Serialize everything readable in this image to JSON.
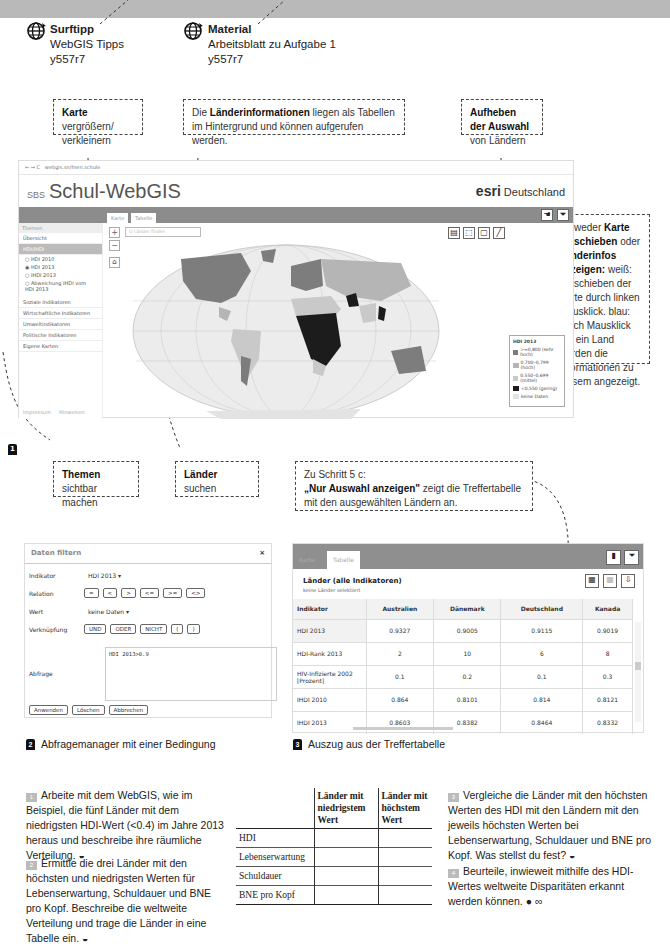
{
  "surftipp": {
    "title": "Surftipp",
    "line1": "WebGIS Tipps",
    "code": "y557r7"
  },
  "material": {
    "title": "Material",
    "line1": "Arbeitsblatt zu Aufgabe 1",
    "code": "y557r7"
  },
  "callouts": {
    "zoom": {
      "bold": "Karte",
      "rest": " vergrößern/ verkleinern"
    },
    "tables": {
      "pre": "Die ",
      "bold": "Länderinformationen",
      "rest": " liegen als Tabellen im Hintergrund und können aufgerufen werden."
    },
    "deselect": {
      "bold": "Aufheben der Auswahl",
      "rest": " von Ländern"
    },
    "pan": {
      "pre": "Entweder ",
      "bold1": "Karte verschieben",
      "mid": " oder ",
      "bold2": "Länderinfos anzeigen:",
      "rest": " weiß: Verschieben der Karte durch linken Mausklick. blau: durch Mausklick auf ein Land werden die Informationen zu diesem angezeigt."
    },
    "themes": {
      "bold": "Themen",
      "rest": " sichtbar machen"
    },
    "search": {
      "bold": "Länder",
      "rest": " suchen"
    },
    "step5c": {
      "line1": "Zu Schritt 5 c:",
      "bold": "„Nur Auswahl anzeigen\"",
      "rest": " zeigt die Treffertabelle mit den ausgewählten Ländern an."
    }
  },
  "webgis": {
    "address": "webgis.sn/fnen.schule",
    "brand_small": "SBS",
    "brand_title": "Schul-WebGIS",
    "esri_logo": "esri",
    "esri_text": "Deutschland",
    "tabs": [
      "Karte",
      "Tabelle"
    ],
    "search_placeholder": "Q Länder finden",
    "sidebar": {
      "header": "Themen",
      "items_top": [
        "Übersicht",
        "HDI/IHDI"
      ],
      "radios": [
        "HDI 2010",
        "HDI 2013",
        "IHDI 2013",
        "Abweichung IHDI vom HDI 2013"
      ],
      "selected_radio": 1,
      "items_bottom": [
        "Soziale Indikatoren",
        "Wirtschaftliche Indikatoren",
        "Umweltindikatoren",
        "Politische Indikatoren",
        "Eigene Karten"
      ],
      "footer": [
        "Impressum",
        "Hinweisen"
      ]
    },
    "legend": {
      "title": "HDI 2013",
      "items": [
        {
          "label": ">=0,800 (sehr hoch)",
          "color": "#7d7d7d"
        },
        {
          "label": "0,700–0,799 (hoch)",
          "color": "#b5b5b5"
        },
        {
          "label": "0,550–0,699 (mittel)",
          "color": "#c9c9c9"
        },
        {
          "label": "<0,550 (gering)",
          "color": "#1c1c1c"
        },
        {
          "label": "keine Daten",
          "color": "#e3e3e3"
        }
      ]
    }
  },
  "figures": {
    "fig1": "1",
    "fig2": {
      "num": "2",
      "label": "Abfragemanager mit einer Bedingung"
    },
    "fig3": {
      "num": "3",
      "label": "Auszug aus der Treffertabelle"
    }
  },
  "filter_dialog": {
    "title": "Daten filtern",
    "close": "×",
    "indikator_label": "Indikator",
    "indikator_value": "HDI 2013 ▾",
    "relation_label": "Relation",
    "relations": [
      "=",
      "<",
      ">",
      "<=",
      ">=",
      "<>"
    ],
    "wert_label": "Wert",
    "wert_value": "keine Daten ▾",
    "verknuepfung_label": "Verknüpfung",
    "logic": [
      "UND",
      "ODER",
      "NICHT",
      "(",
      ")"
    ],
    "abfrage_label": "Abfrage",
    "query": "HDI 2013>0.9",
    "buttons": [
      "Anwenden",
      "Löschen",
      "Abbrechen"
    ]
  },
  "result_table": {
    "tabs": [
      "Karte",
      "Tabelle"
    ],
    "title": "Länder (alle Indikatoren)",
    "subtitle": "keine Länder selektiert",
    "columns": [
      "Indikator",
      "Australien",
      "Dänemark",
      "Deutschland",
      "Kanada"
    ],
    "rows": [
      [
        "HDI 2013",
        "0.9327",
        "0.9005",
        "0.9115",
        "0.9019"
      ],
      [
        "HDI-Rank 2013",
        "2",
        "10",
        "6",
        "8"
      ],
      [
        "HIV-Infizierte 2002 [Prozent]",
        "0.1",
        "0.2",
        "0.1",
        "0.3"
      ],
      [
        "IHDI 2010",
        "0.864",
        "0.8101",
        "0.814",
        "0.8121"
      ],
      [
        "IHDI 2013",
        "0.8603",
        "0.8382",
        "0.8464",
        "0.8332"
      ]
    ]
  },
  "tasks": [
    {
      "num": "1",
      "text": "Arbeite mit dem WebGIS, wie im Beispiel, die fünf Länder mit dem niedrigsten HDI-Wert (<0.4) im Jahre 2013 heraus und beschreibe ihre räumliche Verteilung. ◒"
    },
    {
      "num": "2",
      "text": "Ermittle die drei Länder mit den höchsten und niedrigsten Werten für Lebenserwartung, Schuldauer und BNE pro Kopf. Beschreibe die weltweite Verteilung und trage die Länder in eine Tabelle ein. ◒"
    },
    {
      "num": "3",
      "text": "Vergleiche die Länder mit den höchsten Werten des HDI mit den Ländern mit den jeweils höchsten Werten bei Lebenserwartung, Schuldauer und BNE pro Kopf. Was stellst du fest? ◒"
    },
    {
      "num": "4",
      "text": "Beurteile, inwieweit mithilfe des HDI-Wertes weltweite Disparitäten erkannt werden können. ● ∞"
    }
  ],
  "worksheet_table": {
    "headers": [
      "",
      "Länder mit niedrigstem Wert",
      "Länder mit höchstem Wert"
    ],
    "rows": [
      "HDI",
      "Lebenserwartung",
      "Schuldauer",
      "BNE pro Kopf"
    ]
  }
}
